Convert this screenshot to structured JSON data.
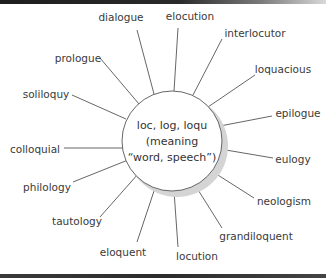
{
  "diagram": {
    "type": "word-web",
    "center": {
      "lines": [
        "loc, log, loqu",
        "(meaning",
        "“word, speech”)"
      ],
      "cx": 172,
      "cy": 141,
      "r": 50
    },
    "words": [
      {
        "label": "dialogue",
        "tx": 121,
        "ty": 21,
        "anchor": "middle",
        "x1": 137,
        "y1": 30,
        "x2": 154,
        "y2": 94
      },
      {
        "label": "elocution",
        "tx": 190,
        "ty": 20,
        "anchor": "middle",
        "x1": 178,
        "y1": 28,
        "x2": 174,
        "y2": 91
      },
      {
        "label": "interlocutor",
        "tx": 255,
        "ty": 37,
        "anchor": "middle",
        "x1": 222,
        "y1": 39,
        "x2": 193,
        "y2": 95
      },
      {
        "label": "loquacious",
        "tx": 283,
        "ty": 73,
        "anchor": "middle",
        "x1": 255,
        "y1": 75,
        "x2": 208,
        "y2": 107
      },
      {
        "label": "epilogue",
        "tx": 298,
        "ty": 117,
        "anchor": "middle",
        "x1": 272,
        "y1": 116,
        "x2": 220,
        "y2": 126
      },
      {
        "label": "eulogy",
        "tx": 293,
        "ty": 163,
        "anchor": "middle",
        "x1": 273,
        "y1": 158,
        "x2": 220,
        "y2": 149
      },
      {
        "label": "neologism",
        "tx": 284,
        "ty": 205,
        "anchor": "middle",
        "x1": 254,
        "y1": 198,
        "x2": 210,
        "y2": 170
      },
      {
        "label": "grandiloquent",
        "tx": 256,
        "ty": 240,
        "anchor": "middle",
        "x1": 222,
        "y1": 228,
        "x2": 195,
        "y2": 185
      },
      {
        "label": "locution",
        "tx": 197,
        "ty": 260,
        "anchor": "middle",
        "x1": 178,
        "y1": 247,
        "x2": 174,
        "y2": 191
      },
      {
        "label": "eloquent",
        "tx": 123,
        "ty": 256,
        "anchor": "middle",
        "x1": 137,
        "y1": 242,
        "x2": 155,
        "y2": 188
      },
      {
        "label": "tautology",
        "tx": 77,
        "ty": 225,
        "anchor": "middle",
        "x1": 100,
        "y1": 217,
        "x2": 138,
        "y2": 174
      },
      {
        "label": "philology",
        "tx": 47,
        "ty": 191,
        "anchor": "middle",
        "x1": 73,
        "y1": 182,
        "x2": 128,
        "y2": 160
      },
      {
        "label": "colloquial",
        "tx": 35,
        "ty": 153,
        "anchor": "middle",
        "x1": 64,
        "y1": 148,
        "x2": 123,
        "y2": 148
      },
      {
        "label": "soliloquy",
        "tx": 46,
        "ty": 98,
        "anchor": "middle",
        "x1": 72,
        "y1": 95,
        "x2": 126,
        "y2": 119
      },
      {
        "label": "prologue",
        "tx": 78,
        "ty": 62,
        "anchor": "middle",
        "x1": 100,
        "y1": 58,
        "x2": 139,
        "y2": 104
      }
    ],
    "colors": {
      "text": "#3a3a3a",
      "line": "#555555",
      "circle_stroke": "#555555",
      "shadow": "#d4d4d4",
      "border": "#222222"
    }
  }
}
